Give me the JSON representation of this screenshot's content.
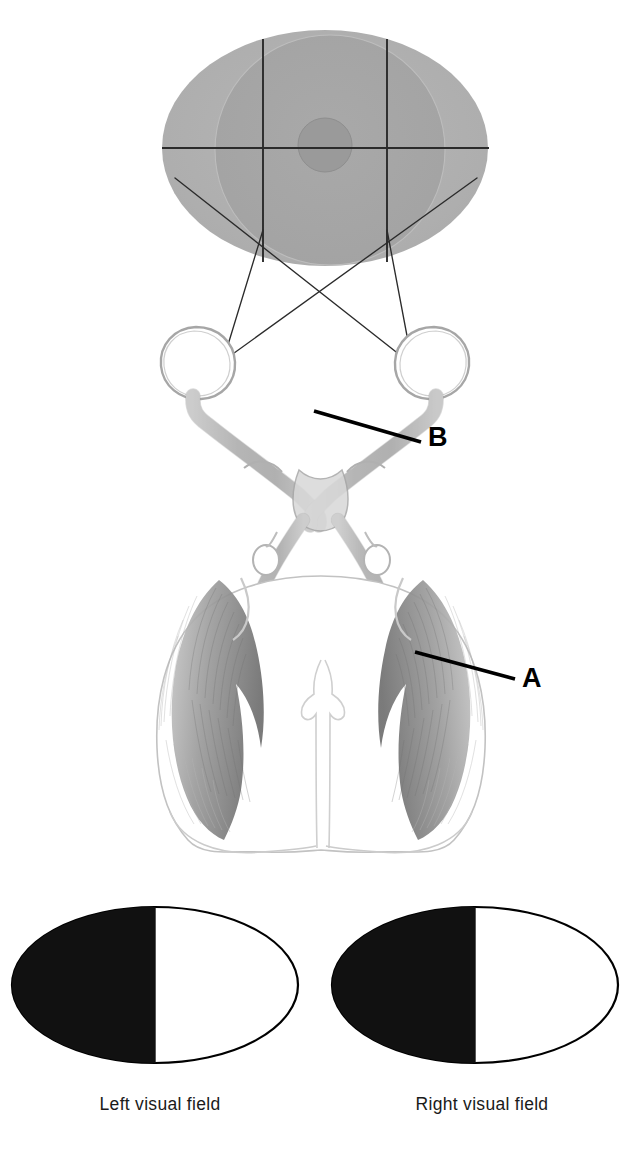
{
  "figure": {
    "background_color": "#ffffff",
    "width": 642,
    "height": 1155
  },
  "visual_field_disc": {
    "name": "binocular visual field",
    "outer_fill": "#b0b0b0",
    "inner_fill": "#a8a8a8",
    "fovea_fill": "#9a9a9a",
    "gridline_color": "#2b2b2b",
    "center_x": 325,
    "center_y": 148,
    "radius_x": 163,
    "radius_y": 118
  },
  "anatomy": {
    "eye_outline_color": "#9a9a9a",
    "nerve_fill": "#c9c9c9",
    "nerve_stroke": "#8d8d8d",
    "cortex_fill": "#9e9e9e",
    "cortex_stroke": "#8a8a8a",
    "brain_outline": "#b4b4b4",
    "left_eye": {
      "cx": 196,
      "cy": 363,
      "r": 35
    },
    "right_eye": {
      "cx": 432,
      "cy": 363,
      "r": 35
    }
  },
  "callouts": [
    {
      "id": "A",
      "label": "A",
      "points_to": "visual cortex / optic radiation",
      "leader_x1": 415,
      "leader_y1": 652,
      "leader_x2": 515,
      "leader_y2": 679
    },
    {
      "id": "B",
      "label": "B",
      "points_to": "optic nerve",
      "leader_x1": 314,
      "leader_y1": 411,
      "leader_x2": 421,
      "leader_y2": 442
    }
  ],
  "projection_rays": {
    "stroke": "#2b2b2b",
    "stroke_width": 1.4,
    "description": "Rays from the lateral edges of the visual field crossing to the opposite eye"
  },
  "visual_fields": [
    {
      "id": "left-visual-field",
      "caption": "Left visual field",
      "shaded_half": "left",
      "shade_color": "#111111",
      "unshaded_color": "#ffffff",
      "outline_color": "#000000",
      "cx": 155,
      "cy": 985,
      "rx": 143,
      "ry": 78
    },
    {
      "id": "right-visual-field",
      "caption": "Right visual field",
      "shaded_half": "left",
      "shade_color": "#111111",
      "unshaded_color": "#ffffff",
      "outline_color": "#000000",
      "cx": 475,
      "cy": 985,
      "rx": 143,
      "ry": 78
    }
  ]
}
